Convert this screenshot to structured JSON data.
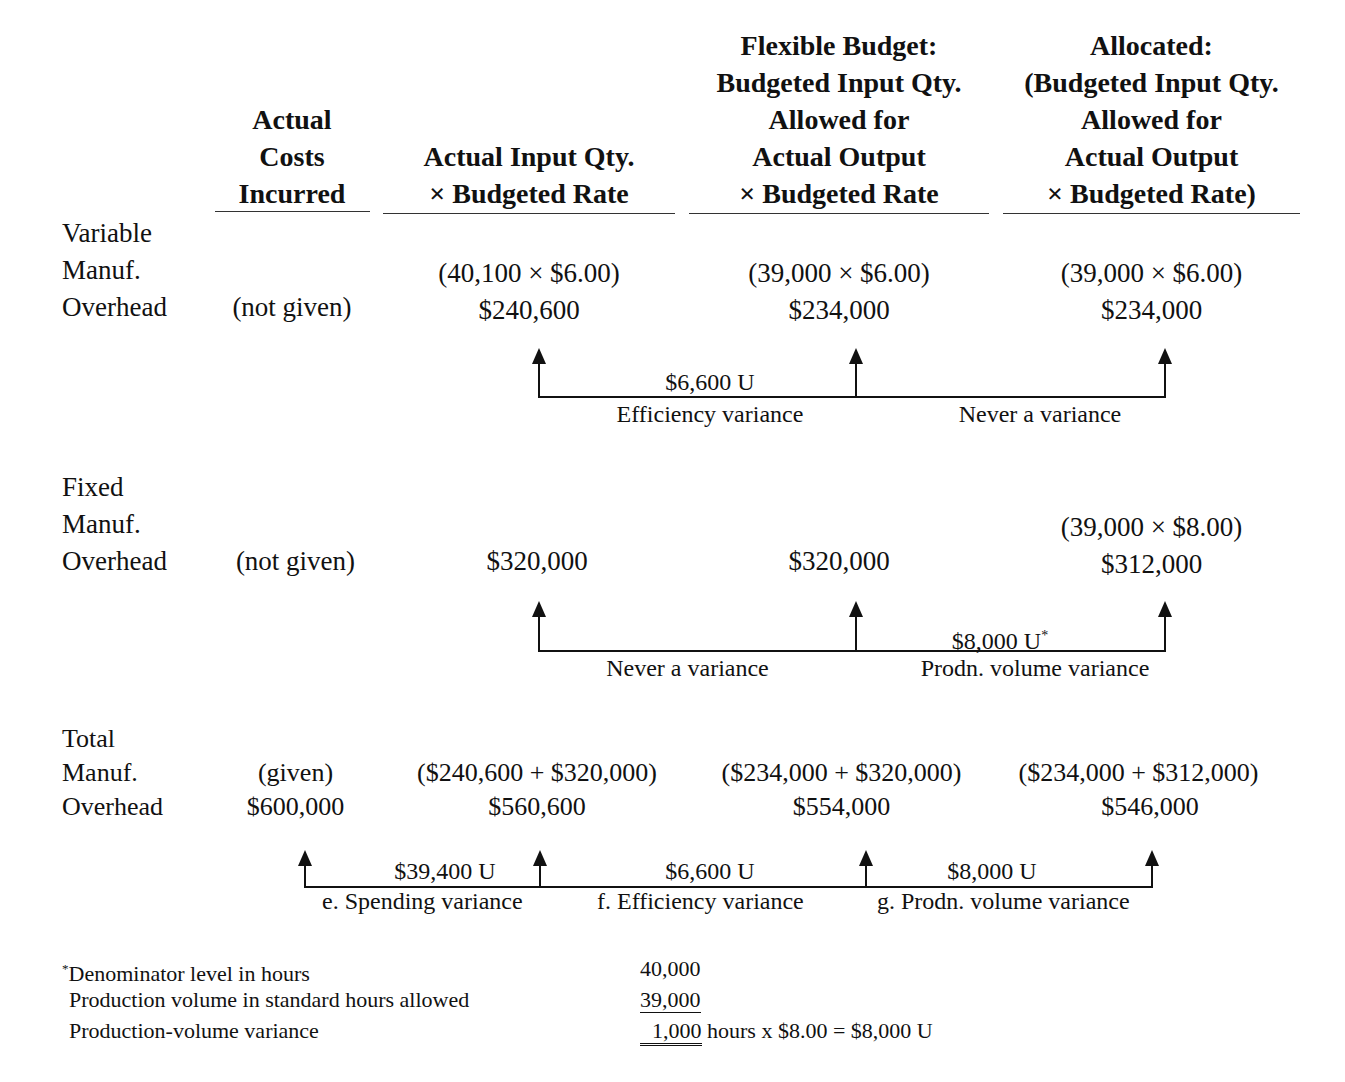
{
  "columns": [
    {
      "header": "Actual\nCosts\nIncurred"
    },
    {
      "header": "Actual Input Qty.\n× Budgeted Rate"
    },
    {
      "header": "Flexible Budget:\nBudgeted Input Qty.\nAllowed for\nActual Output\n× Budgeted Rate"
    },
    {
      "header": "Allocated:\n(Budgeted Input Qty.\nAllowed for\nActual Output\n× Budgeted Rate)"
    }
  ],
  "variable": {
    "label": "Variable\nManuf.\nOverhead",
    "actual": "(not given)",
    "col2_calc": "(40,100 × $6.00)",
    "col2_value": "$240,600",
    "col3_calc": "(39,000 × $6.00)",
    "col3_value": "$234,000",
    "col4_calc": "(39,000 × $6.00)",
    "col4_value": "$234,000",
    "variance1_amount": "$6,600 U",
    "variance1_label": "Efficiency variance",
    "variance2_label": "Never a variance"
  },
  "fixed": {
    "label": "Fixed\nManuf.\nOverhead",
    "actual": "(not given)",
    "col2_value": "$320,000",
    "col3_value": "$320,000",
    "col4_calc": "(39,000 × $8.00)",
    "col4_value": "$312,000",
    "variance1_label": "Never a variance",
    "variance2_amount": "$8,000 U",
    "variance2_marker": "*",
    "variance2_label": "Prodn. volume variance"
  },
  "total": {
    "label": "Total\nManuf.\nOverhead",
    "actual_calc": "(given)",
    "actual_value": "$600,000",
    "col2_calc": "($240,600 + $320,000)",
    "col2_value": "$560,600",
    "col3_calc": "($234,000 + $320,000)",
    "col3_value": "$554,000",
    "col4_calc": "($234,000 + $312,000)",
    "col4_value": "$546,000",
    "variances": [
      {
        "amount": "$39,400 U",
        "label": "e.  Spending variance"
      },
      {
        "amount": "$6,600 U",
        "label": "f.  Efficiency variance"
      },
      {
        "amount": "$8,000 U",
        "label": "g. Prodn. volume variance"
      }
    ]
  },
  "footnote": {
    "marker": "*",
    "rows": [
      {
        "label": "Denominator level in hours",
        "value": "40,000",
        "suffix": ""
      },
      {
        "label": "Production volume in standard hours allowed",
        "value": "39,000",
        "suffix": ""
      },
      {
        "label": "Production-volume variance",
        "value": "1,000",
        "suffix": " hours x $8.00 = $8,000 U"
      }
    ]
  }
}
